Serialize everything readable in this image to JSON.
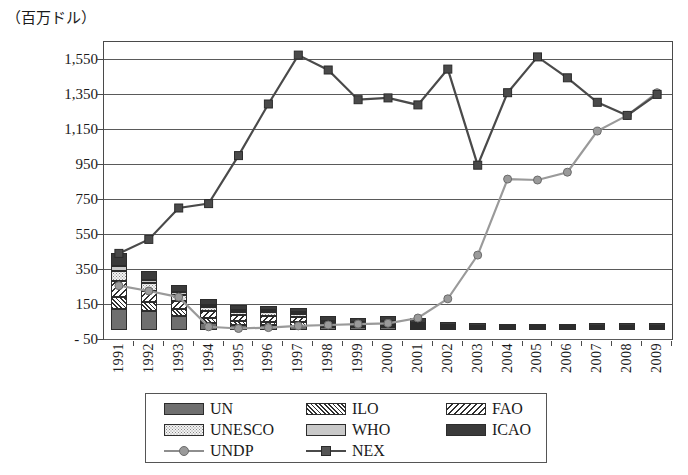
{
  "chart_data": {
    "type": "bar",
    "title": "（百万ドル）",
    "ylabel": "（百万ドル）",
    "xlabel": "",
    "ylim": [
      -50,
      1650
    ],
    "ytick_values": [
      -50,
      150,
      350,
      550,
      750,
      950,
      1150,
      1350,
      1550
    ],
    "ytick_labels": [
      "- 50",
      "150",
      "350",
      "550",
      "750",
      "950",
      "1,150",
      "1,350",
      "1,550"
    ],
    "grid": true,
    "legend_position": "bottom",
    "categories": [
      "1991",
      "1992",
      "1993",
      "1994",
      "1995",
      "1996",
      "1997",
      "1998",
      "1999",
      "2000",
      "2001",
      "2002",
      "2003",
      "2004",
      "2005",
      "2006",
      "2007",
      "2008",
      "2009"
    ],
    "stacked_series": [
      {
        "name": "UN",
        "pattern": "solid-dark-gray",
        "color": "#6f6f6f",
        "values": [
          120,
          108,
          82,
          40,
          30,
          28,
          26,
          18,
          16,
          18,
          14,
          10,
          8,
          6,
          6,
          6,
          6,
          6,
          6
        ]
      },
      {
        "name": "ILO",
        "pattern": "diagonal-hatch-back",
        "color": "#2f2f2f",
        "values": [
          72,
          54,
          40,
          30,
          24,
          22,
          20,
          10,
          8,
          10,
          8,
          6,
          4,
          4,
          4,
          4,
          4,
          4,
          4
        ]
      },
      {
        "name": "FAO",
        "pattern": "diagonal-hatch-forward",
        "color": "#2f2f2f",
        "values": [
          90,
          62,
          48,
          40,
          34,
          34,
          30,
          12,
          10,
          12,
          10,
          8,
          6,
          4,
          4,
          4,
          4,
          4,
          4
        ]
      },
      {
        "name": "UNESCO",
        "pattern": "dotted-light",
        "color": "#f2f2f2",
        "values": [
          58,
          44,
          30,
          22,
          18,
          18,
          16,
          8,
          6,
          8,
          6,
          4,
          4,
          4,
          4,
          4,
          4,
          4,
          4
        ]
      },
      {
        "name": "WHO",
        "pattern": "solid-light-gray",
        "color": "#c9c9c9",
        "values": [
          30,
          22,
          18,
          14,
          12,
          12,
          10,
          6,
          6,
          6,
          6,
          4,
          4,
          4,
          4,
          4,
          4,
          4,
          4
        ]
      },
      {
        "name": "ICAO",
        "pattern": "solid-black",
        "color": "#3a3a3a",
        "values": [
          70,
          52,
          40,
          32,
          26,
          26,
          24,
          26,
          24,
          26,
          26,
          18,
          16,
          16,
          16,
          16,
          18,
          20,
          22
        ]
      }
    ],
    "line_series": [
      {
        "name": "UNDP",
        "marker": "circle",
        "color": "#9a9a9a",
        "values": [
          255,
          225,
          190,
          20,
          10,
          15,
          25,
          30,
          35,
          40,
          70,
          180,
          430,
          865,
          860,
          905,
          1140,
          1230,
          1360
        ]
      },
      {
        "name": "NEX",
        "marker": "square",
        "color": "#4a4a4a",
        "values": [
          440,
          520,
          700,
          725,
          1000,
          1295,
          1575,
          1490,
          1320,
          1330,
          1290,
          1495,
          945,
          1360,
          1565,
          1445,
          1305,
          1230,
          1350
        ]
      }
    ],
    "bar_totals": [
      440,
      342,
      258,
      178,
      144,
      140,
      126,
      80,
      70,
      80,
      70,
      50,
      42,
      38,
      38,
      38,
      40,
      42,
      44
    ]
  },
  "legend": {
    "items": [
      {
        "label": "UN",
        "type": "patch",
        "key": "UN"
      },
      {
        "label": "ILO",
        "type": "patch",
        "key": "ILO"
      },
      {
        "label": "FAO",
        "type": "patch",
        "key": "FAO"
      },
      {
        "label": "UNESCO",
        "type": "patch",
        "key": "UNESCO"
      },
      {
        "label": "WHO",
        "type": "patch",
        "key": "WHO"
      },
      {
        "label": "ICAO",
        "type": "patch",
        "key": "ICAO"
      },
      {
        "label": "UNDP",
        "type": "line",
        "key": "UNDP"
      },
      {
        "label": "NEX",
        "type": "line",
        "key": "NEX"
      }
    ]
  },
  "colors": {
    "axis": "#4a4a4a",
    "grid": "#5a5a5a",
    "undp": "#9a9a9a",
    "nex": "#4a4a4a",
    "background": "#ffffff"
  }
}
